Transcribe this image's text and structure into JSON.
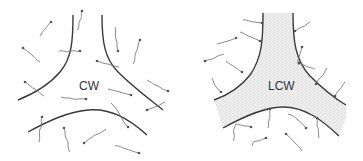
{
  "diagram": {
    "panels": [
      {
        "id": "left",
        "label": "CW",
        "description": "Three unlignified cell walls meeting at a junction; wavy arrows pass through the walls"
      },
      {
        "id": "right",
        "label": "LCW",
        "description": "Lignified cell wall region (stippled) at a three-cell junction; wavy arrows stop at the wall boundary"
      }
    ],
    "colors": {
      "wall_line": "#3a3a3a",
      "arrow": "#7a7a7a",
      "stipple_fill": "#e6e6e6",
      "background": "#ffffff"
    }
  }
}
